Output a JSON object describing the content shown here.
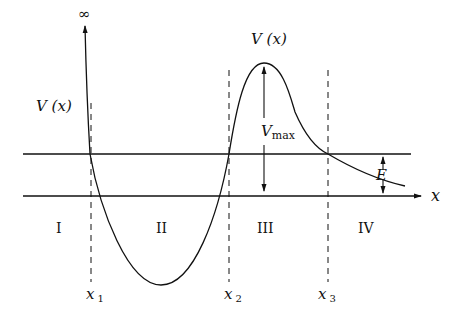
{
  "diagram": {
    "type": "potential-energy-curve",
    "axis_labels": {
      "x_axis": "x",
      "y_axis_top": "∞"
    },
    "curve_labels": {
      "left": "V (x)",
      "peak": "V (x)"
    },
    "annotations": {
      "vmax_main": "V",
      "vmax_sub": "max",
      "energy": "E"
    },
    "regions": [
      "I",
      "II",
      "III",
      "IV"
    ],
    "turning_points": [
      {
        "main": "x",
        "sub": "1"
      },
      {
        "main": "x",
        "sub": "2"
      },
      {
        "main": "x",
        "sub": "3"
      }
    ],
    "colors": {
      "line": "#111111",
      "background": "#ffffff"
    }
  }
}
